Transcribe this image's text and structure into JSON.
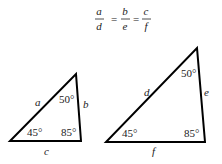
{
  "equation": {
    "frac1": {
      "num": "a",
      "den": "d"
    },
    "frac2": {
      "num": "b",
      "den": "e"
    },
    "frac3": {
      "num": "c",
      "den": "f"
    },
    "eq": "="
  },
  "small_triangle": {
    "sides": {
      "left": "a",
      "right": "b",
      "bottom": "c"
    },
    "angles": {
      "bottom_left": "45°",
      "bottom_right": "85°",
      "top": "50°"
    }
  },
  "large_triangle": {
    "sides": {
      "left": "d",
      "right": "e",
      "bottom": "f"
    },
    "angles": {
      "bottom_left": "45°",
      "bottom_right": "85°",
      "top": "50°"
    }
  }
}
